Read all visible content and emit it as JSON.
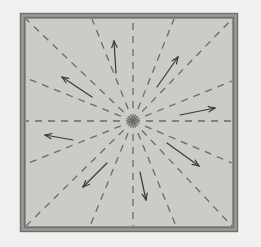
{
  "figure": {
    "canvas": {
      "width": 261,
      "height": 247
    },
    "colors": {
      "page_background": "#f2f0ee",
      "panel_fill": "#cdcbc8",
      "frame_stroke": "#6f6f6f",
      "frame_inner_stroke": "#8a8a86",
      "ray_stroke": "#6a6a6a",
      "arrow_stroke": "#3a3a3a"
    },
    "frame": {
      "outer": {
        "x": 20,
        "y": 13,
        "width": 218,
        "height": 219
      },
      "inner": {
        "x": 24,
        "y": 17,
        "width": 210,
        "height": 211
      },
      "outer_stroke_width": 1.4,
      "inner_stroke_width": 1.4,
      "band_fill": "#9a9a96"
    },
    "panel": {
      "x": 26,
      "y": 19,
      "width": 206,
      "height": 207
    },
    "center": {
      "x": 133,
      "y": 121,
      "label": "convergence point"
    },
    "ray_style": {
      "dash_pattern": "7 6",
      "stroke_width": 1.3,
      "count": 16
    },
    "rays": [
      {
        "name": "ray-right",
        "angle_deg": 0,
        "x2": 232,
        "y2": 121
      },
      {
        "name": "ray-up-right-shallow",
        "angle_deg": 22,
        "x2": 232,
        "y2": 81
      },
      {
        "name": "ray-up-right-mid",
        "angle_deg": 45,
        "x2": 232,
        "y2": 19
      },
      {
        "name": "ray-up-right-steep",
        "angle_deg": 68,
        "x2": 174,
        "y2": 19
      },
      {
        "name": "ray-up",
        "angle_deg": 90,
        "x2": 133,
        "y2": 19
      },
      {
        "name": "ray-up-left-steep",
        "angle_deg": 112,
        "x2": 92,
        "y2": 19
      },
      {
        "name": "ray-up-left-mid",
        "angle_deg": 135,
        "x2": 26,
        "y2": 19
      },
      {
        "name": "ray-up-left-shallow",
        "angle_deg": 158,
        "x2": 26,
        "y2": 78
      },
      {
        "name": "ray-left",
        "angle_deg": 180,
        "x2": 26,
        "y2": 121
      },
      {
        "name": "ray-down-left-shallow",
        "angle_deg": 202,
        "x2": 26,
        "y2": 164
      },
      {
        "name": "ray-down-left-mid",
        "angle_deg": 225,
        "x2": 26,
        "y2": 226
      },
      {
        "name": "ray-down-left-steep",
        "angle_deg": 248,
        "x2": 90,
        "y2": 226
      },
      {
        "name": "ray-down",
        "angle_deg": 270,
        "x2": 133,
        "y2": 226
      },
      {
        "name": "ray-down-right-steep",
        "angle_deg": 292,
        "x2": 176,
        "y2": 226
      },
      {
        "name": "ray-down-right-mid",
        "angle_deg": 315,
        "x2": 232,
        "y2": 226
      },
      {
        "name": "ray-down-right-shallow",
        "angle_deg": 338,
        "x2": 232,
        "y2": 163
      }
    ],
    "arrow_style": {
      "stroke_width": 1.2,
      "head_length": 7,
      "head_angle_deg": 22
    },
    "arrows": [
      {
        "name": "arrow-up",
        "x1": 116,
        "y1": 73,
        "x2": 114,
        "y2": 41,
        "direction": "up"
      },
      {
        "name": "arrow-up-right",
        "x1": 157,
        "y1": 87,
        "x2": 178,
        "y2": 57,
        "direction": "up-right"
      },
      {
        "name": "arrow-right",
        "x1": 180,
        "y1": 115,
        "x2": 215,
        "y2": 108,
        "direction": "right"
      },
      {
        "name": "arrow-down-right",
        "x1": 167,
        "y1": 143,
        "x2": 199,
        "y2": 166,
        "direction": "down-right"
      },
      {
        "name": "arrow-down",
        "x1": 140,
        "y1": 172,
        "x2": 146,
        "y2": 200,
        "direction": "down"
      },
      {
        "name": "arrow-down-left",
        "x1": 107,
        "y1": 163,
        "x2": 83,
        "y2": 187,
        "direction": "down-left"
      },
      {
        "name": "arrow-left",
        "x1": 73,
        "y1": 140,
        "x2": 45,
        "y2": 135,
        "direction": "left"
      },
      {
        "name": "arrow-up-left",
        "x1": 92,
        "y1": 97,
        "x2": 62,
        "y2": 77,
        "direction": "up-left"
      }
    ]
  }
}
